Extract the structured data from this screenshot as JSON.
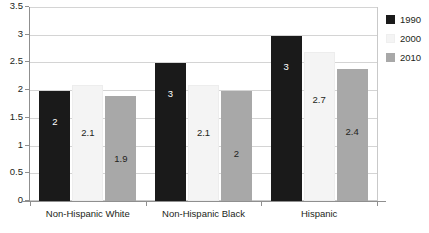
{
  "chart_data": {
    "type": "bar",
    "title": "",
    "xlabel": "",
    "ylabel": "",
    "ylim": [
      0,
      3.5
    ],
    "ytick_step": 0.5,
    "ytick_labels": [
      "0",
      "0.5",
      "1",
      "1.5",
      "2",
      "2.5",
      "3",
      "3.5"
    ],
    "grid": true,
    "legend_position": "right-outside",
    "categories": [
      "Non-Hispanic White",
      "Non-Hispanic Black",
      "Hispanic"
    ],
    "series": [
      {
        "name": "1990",
        "color": "#1a1a1a",
        "values": [
          2,
          2.5,
          3
        ],
        "labels": [
          "2",
          "3",
          "3"
        ]
      },
      {
        "name": "2000",
        "color": "#f4f4f4",
        "values": [
          2.1,
          2.1,
          2.7
        ],
        "labels": [
          "2.1",
          "2.1",
          "2.7"
        ]
      },
      {
        "name": "2010",
        "color": "#a8a8a8",
        "values": [
          1.9,
          2,
          2.4
        ],
        "labels": [
          "1.9",
          "2",
          "2.4"
        ]
      }
    ]
  },
  "legend": {
    "items": [
      {
        "label": "1990",
        "swatch": "legend-swatch-1990"
      },
      {
        "label": "2000",
        "swatch": "legend-swatch-2000"
      },
      {
        "label": "2010",
        "swatch": "legend-swatch-2010"
      }
    ]
  }
}
